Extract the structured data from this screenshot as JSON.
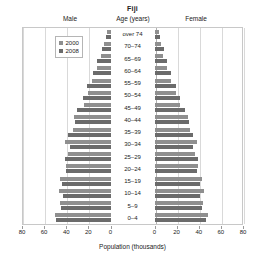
{
  "chart_data": {
    "type": "bar",
    "subtype": "population-pyramid",
    "title": "Fiji",
    "xlabel": "Population (thousands)",
    "ylabel": "Age (years)",
    "grid": true,
    "legend_position": "upper-left-inside",
    "left_header": "Male",
    "center_header": "Age (years)",
    "right_header": "Female",
    "xlim": [
      0,
      80
    ],
    "xticks": [
      80,
      60,
      40,
      20,
      0,
      0,
      20,
      40,
      60,
      80
    ],
    "xticks_left": [
      80,
      60,
      40,
      20,
      0
    ],
    "xticks_right": [
      0,
      20,
      40,
      60,
      80
    ],
    "categories": [
      "over 74",
      "70–74",
      "65–69",
      "60–64",
      "55–59",
      "50–54",
      "45–49",
      "40–44",
      "35–39",
      "30–34",
      "25–29",
      "20–24",
      "15–19",
      "10–14",
      "5–9",
      "0–4"
    ],
    "series": [
      {
        "name": "2000",
        "color": "#8f8f8f",
        "male": [
          3,
          6,
          9,
          12,
          17,
          20,
          24,
          33,
          34,
          41,
          38,
          40,
          46,
          47,
          46,
          50
        ],
        "female": [
          4,
          6,
          8,
          11,
          15,
          19,
          23,
          30,
          32,
          38,
          37,
          39,
          43,
          45,
          44,
          48
        ]
      },
      {
        "name": "2008",
        "color": "#6b6b6b",
        "male": [
          4,
          8,
          12,
          16,
          21,
          25,
          30,
          32,
          38,
          37,
          41,
          40,
          44,
          43,
          45,
          49
        ],
        "female": [
          5,
          9,
          11,
          15,
          19,
          23,
          28,
          31,
          35,
          35,
          39,
          38,
          41,
          41,
          43,
          47
        ]
      }
    ]
  },
  "legend": {
    "items": [
      {
        "label": "2000"
      },
      {
        "label": "2008"
      }
    ]
  },
  "icons": {
    "legend_swatch": "square-swatch-icon"
  }
}
